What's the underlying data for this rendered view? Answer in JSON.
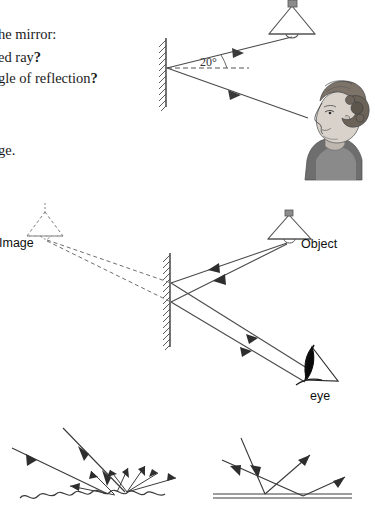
{
  "document": {
    "type": "physics-worksheet-reflection-of-light",
    "background_color": "#ffffff",
    "ink_color": "#555555",
    "text_color": "#1b1b1b"
  },
  "question_text": {
    "line1": "he mirror:",
    "line2_plain": "ed ray",
    "line2_bold": "?",
    "line3_plain": "gle of reflection",
    "line3_bold": "?",
    "line4": "ge."
  },
  "diagram1": {
    "name": "mirror-reflection-20-degrees",
    "angle_label": "20°",
    "mirror": {
      "x": 166,
      "y_top": 38,
      "y_bottom": 106,
      "hatching": true
    },
    "incidence_point": {
      "x": 167,
      "y": 68
    },
    "normal_dashed_line": {
      "from_x": 167,
      "to_x": 248,
      "y": 68
    },
    "incident_ray": {
      "from_x": 268,
      "from_y": 30,
      "to_x": 167,
      "to_y": 68
    },
    "reflected_ray": {
      "from_x": 167,
      "from_y": 68,
      "to_x": 306,
      "to_y": 118
    },
    "lamp": {
      "x": 292,
      "y": 20,
      "label": ""
    },
    "observer": {
      "type": "woman-head-profile",
      "x": 338,
      "y": 137
    }
  },
  "diagram2": {
    "name": "virtual-image-formation",
    "image_label": "Image",
    "object_label": "Object",
    "eye_label": "eye",
    "mirror": {
      "x": 170,
      "y_top": 253,
      "y_bottom": 346,
      "hatching": true
    },
    "image_lamp": {
      "x": 45,
      "y": 224,
      "style": "dashed"
    },
    "object_lamp": {
      "x": 289,
      "y": 228,
      "style": "solid"
    },
    "reflection_points": [
      {
        "x": 171,
        "y": 283
      },
      {
        "x": 171,
        "y": 302
      }
    ],
    "eye": {
      "x": 318,
      "y": 368
    }
  },
  "diagram3": {
    "name": "diffuse-reflection-rough-surface",
    "surface": "rough-wavy",
    "incident_ray_count": 2,
    "scattered_ray_count": 6,
    "caption": ""
  },
  "diagram4": {
    "name": "specular-reflection-smooth-surface",
    "surface": "flat-smooth",
    "incident_ray_count": 2,
    "reflected_ray_count": 2,
    "caption": ""
  }
}
